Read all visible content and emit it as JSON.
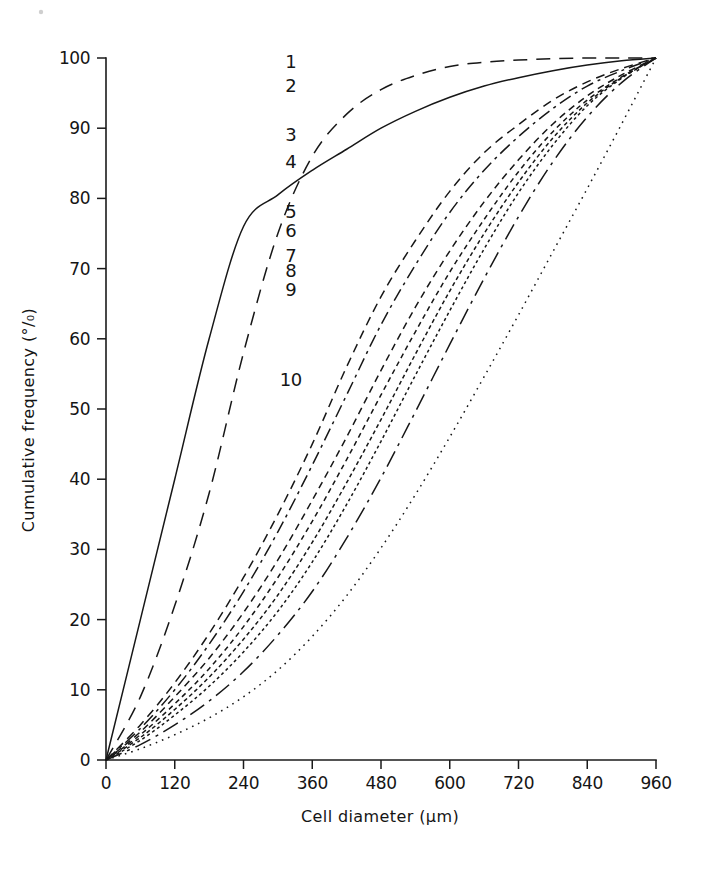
{
  "figure": {
    "background_color": "#ffffff",
    "ink_color": "#171717"
  },
  "axes": {
    "x_title": "Cell diameter  (µm)",
    "y_title": "Cumulative frequency  (°/₀)",
    "x_ticks": [
      "0",
      "120",
      "240",
      "360",
      "480",
      "600",
      "720",
      "840",
      "960"
    ],
    "y_ticks": [
      "0",
      "10",
      "20",
      "30",
      "40",
      "50",
      "60",
      "70",
      "80",
      "90",
      "100"
    ]
  },
  "curve_labels": [
    {
      "text": "1",
      "x": 600,
      "y": 99.5
    },
    {
      "text": "2",
      "x": 600,
      "y": 96.0
    },
    {
      "text": "3",
      "x": 600,
      "y": 89.0
    },
    {
      "text": "4",
      "x": 600,
      "y": 85.2
    },
    {
      "text": "5",
      "x": 600,
      "y": 78.0
    },
    {
      "text": "6",
      "x": 600,
      "y": 75.4
    },
    {
      "text": "7",
      "x": 600,
      "y": 71.8
    },
    {
      "text": "8",
      "x": 600,
      "y": 69.6
    },
    {
      "text": "9",
      "x": 600,
      "y": 67.0
    },
    {
      "text": "10",
      "x": 600,
      "y": 54.2
    }
  ],
  "chart_data": {
    "type": "line",
    "title": "",
    "xlabel": "Cell diameter  (µm)",
    "ylabel": "Cumulative frequency  (°/₀)",
    "xlim": [
      0,
      960
    ],
    "ylim": [
      0,
      100
    ],
    "xticks": [
      0,
      120,
      240,
      360,
      480,
      600,
      720,
      840,
      960
    ],
    "yticks": [
      0,
      10,
      20,
      30,
      40,
      50,
      60,
      70,
      80,
      90,
      100
    ],
    "grid": false,
    "legend": "inline-numbered-labels",
    "x": [
      0,
      60,
      120,
      180,
      240,
      300,
      360,
      420,
      480,
      540,
      600,
      660,
      720,
      780,
      840,
      900,
      960
    ],
    "series": [
      {
        "name": "1",
        "dash": "14,9",
        "values": [
          0,
          9,
          22,
          38,
          58,
          75,
          86,
          92,
          95.5,
          97.5,
          98.8,
          99.4,
          99.7,
          99.9,
          100,
          100,
          100
        ]
      },
      {
        "name": "2",
        "dash": "none",
        "values": [
          0,
          20,
          40,
          60,
          76,
          80.5,
          84,
          87,
          90,
          92.4,
          94.4,
          96,
          97.2,
          98.2,
          99,
          99.6,
          100
        ]
      },
      {
        "name": "3",
        "dash": "9,6",
        "values": [
          0,
          5,
          11,
          18,
          26,
          35,
          45,
          56,
          66,
          74,
          81,
          86.5,
          90.5,
          94,
          96.6,
          98.5,
          100
        ]
      },
      {
        "name": "4",
        "dash": "13,5,3,5",
        "values": [
          0,
          4.5,
          10,
          16.5,
          24,
          32.5,
          42,
          52,
          62,
          70.5,
          78,
          84,
          88.8,
          92.8,
          96,
          98.2,
          100
        ]
      },
      {
        "name": "5",
        "dash": "7,5",
        "values": [
          0,
          4,
          9,
          14.5,
          21,
          28.5,
          37,
          46,
          55.5,
          64.5,
          72.5,
          79.5,
          85.5,
          90.6,
          94.6,
          97.6,
          100
        ]
      },
      {
        "name": "6",
        "dash": "5,4",
        "values": [
          0,
          3.6,
          8,
          13,
          19,
          26,
          34,
          42.8,
          52,
          61,
          69.5,
          77,
          83.8,
          89.5,
          94,
          97.3,
          100
        ]
      },
      {
        "name": "7",
        "dash": "4,3",
        "values": [
          0,
          3.2,
          7.2,
          11.8,
          17.2,
          23.5,
          31,
          39.5,
          48.5,
          57.8,
          66.8,
          75,
          82.3,
          88.6,
          93.6,
          97.2,
          100
        ]
      },
      {
        "name": "8",
        "dash": "3,3",
        "values": [
          0,
          2.8,
          6.4,
          10.5,
          15.4,
          21.2,
          28.2,
          36.4,
          45.4,
          54.8,
          64,
          72.8,
          80.8,
          87.6,
          93.2,
          97.1,
          100
        ]
      },
      {
        "name": "9",
        "dash": "17,6,3,6",
        "values": [
          0,
          2.2,
          5,
          8.4,
          12.6,
          17.8,
          24,
          31.6,
          40.2,
          49.6,
          59.2,
          68.6,
          77.4,
          85.2,
          91.6,
          96.5,
          100
        ]
      },
      {
        "name": "10",
        "dash": "1.6,5",
        "values": [
          0,
          1.6,
          3.6,
          6,
          9,
          12.8,
          17.6,
          23.4,
          30.2,
          37.8,
          46,
          54.6,
          63.4,
          72.4,
          81.4,
          90.6,
          100
        ]
      }
    ]
  }
}
